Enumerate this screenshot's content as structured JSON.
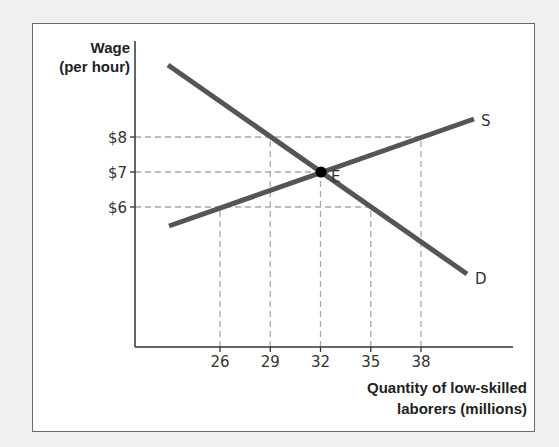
{
  "chart_data": {
    "type": "line",
    "title": "",
    "ylabel": "Wage (per hour)",
    "ylabel_lines": [
      "Wage",
      "(per hour)"
    ],
    "xlabel": "Quantity of low-skilled laborers (millions)",
    "xlabel_lines": [
      "Quantity of low-skilled",
      "laborers (millions)"
    ],
    "y_ticks": [
      {
        "label": "$8",
        "value": 8
      },
      {
        "label": "$7",
        "value": 7
      },
      {
        "label": "$6",
        "value": 6
      }
    ],
    "x_ticks": [
      {
        "label": "26",
        "value": 26
      },
      {
        "label": "29",
        "value": 29
      },
      {
        "label": "32",
        "value": 32
      },
      {
        "label": "35",
        "value": 35
      },
      {
        "label": "38",
        "value": 38
      }
    ],
    "series": [
      {
        "name": "D",
        "label": "D",
        "description": "Demand curve (downward sloping)",
        "points": [
          {
            "x": 29,
            "y": 8
          },
          {
            "x": 32,
            "y": 7
          },
          {
            "x": 35,
            "y": 6
          }
        ]
      },
      {
        "name": "S",
        "label": "S",
        "description": "Supply curve (upward sloping)",
        "points": [
          {
            "x": 26,
            "y": 6
          },
          {
            "x": 32,
            "y": 7
          },
          {
            "x": 38,
            "y": 8
          }
        ]
      }
    ],
    "equilibrium": {
      "label": "E",
      "x": 32,
      "y": 7
    },
    "reference_lines": {
      "horizontal": [
        8,
        7,
        6
      ],
      "vertical": [
        26,
        29,
        32,
        35,
        38
      ],
      "style": "dashed"
    },
    "grid": false,
    "legend": "none (curves labeled directly)",
    "colors": {
      "curves": "#555555",
      "dashed": "#aaaaaa",
      "axes": "#333333",
      "equilibrium_point": "#000000"
    }
  }
}
